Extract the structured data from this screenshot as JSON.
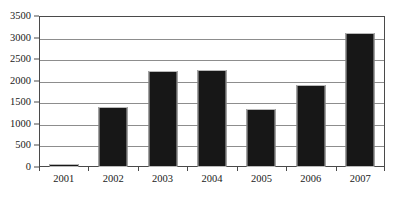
{
  "chart_data": {
    "type": "bar",
    "title": "",
    "subtitle": "",
    "xlabel": "",
    "ylabel": "",
    "categories": [
      "2001",
      "2002",
      "2003",
      "2004",
      "2005",
      "2006",
      "2007"
    ],
    "values": [
      60,
      1400,
      2220,
      2250,
      1350,
      1900,
      3100
    ],
    "series": [
      {
        "name": "",
        "values": [
          60,
          1400,
          2220,
          2250,
          1350,
          1900,
          3100
        ]
      }
    ],
    "ylim": [
      0,
      3500
    ],
    "ytick_step": 500,
    "ytick_labels": [
      "0",
      "500",
      "1000",
      "1500",
      "2000",
      "2500",
      "3000",
      "3500"
    ],
    "ytick_values": [
      0,
      500,
      1000,
      1500,
      2000,
      2500,
      3000,
      3500
    ],
    "grid": true,
    "grid_axis": "y",
    "legend": false,
    "legend_position": "none",
    "annotations": [],
    "colors": {
      "bar_fill": "#171717",
      "bar_outline": "#b9b9b9",
      "gridline": "#8d8d8d",
      "axis": "#4a4a4a",
      "text": "#1a1a1a",
      "background": "#ffffff"
    }
  }
}
